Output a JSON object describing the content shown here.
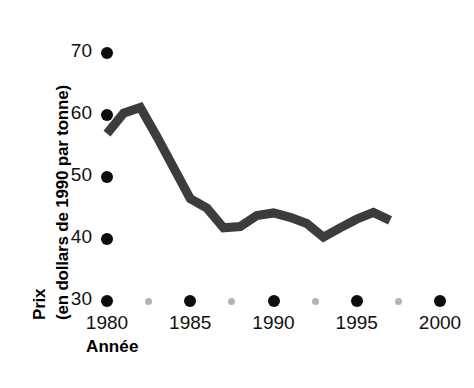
{
  "chart_data": {
    "type": "line",
    "title": "",
    "xlabel": "Année",
    "ylabel": "Prix (en dollars de 1990 par tonne)",
    "ylabel_line1": "Prix",
    "ylabel_line2": "(en dollars de 1990 par tonne)",
    "xlim": [
      1979,
      2001
    ],
    "ylim": [
      30,
      70
    ],
    "grid": false,
    "legend": null,
    "y_ticks": [
      70,
      60,
      50,
      40,
      30
    ],
    "y_tick_labels": [
      "70",
      "60",
      "50",
      "40",
      "30"
    ],
    "x_ticks": [
      1980,
      1985,
      1990,
      1995,
      2000
    ],
    "x_tick_labels": [
      "1980",
      "1985",
      "1990",
      "1995",
      "2000"
    ],
    "x_minor_ticks": [
      1982.5,
      1987.5,
      1992.5,
      1997.5
    ],
    "series": [
      {
        "name": "Prix",
        "color": "#3c3c3c",
        "x": [
          1980,
          1981,
          1982,
          1983,
          1984,
          1985,
          1986,
          1987,
          1988,
          1989,
          1990,
          1991,
          1992,
          1993,
          1994,
          1995,
          1996,
          1997
        ],
        "values": [
          57.0,
          60.3,
          61.2,
          56.5,
          51.5,
          46.5,
          45.0,
          41.8,
          42.0,
          43.8,
          44.2,
          43.5,
          42.5,
          40.3,
          41.8,
          43.2,
          44.3,
          43.0
        ]
      }
    ]
  },
  "axis": {
    "y_title_line1": "Prix",
    "y_title_line2": "(en dollars de 1990 par tonne)",
    "x_title": "Année"
  },
  "colors": {
    "line": "#3c3c3c",
    "tick_major_dot": "#0d0d0d",
    "tick_minor_dot": "#b3b3b3",
    "text": "#111111",
    "background": "#ffffff"
  }
}
